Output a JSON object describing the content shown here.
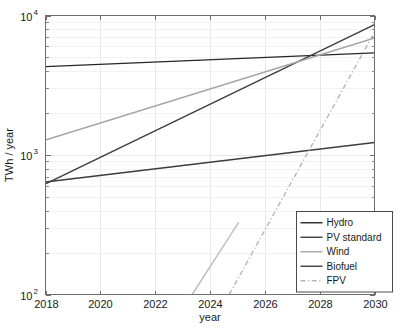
{
  "chart_data": {
    "type": "line",
    "title": "",
    "xlabel": "year",
    "ylabel": "TWh / year",
    "xlim": [
      2018,
      2030
    ],
    "ylim": [
      100,
      10000
    ],
    "yscale": "log",
    "grid": true,
    "legend_position": "lower-right",
    "xticks": [
      "2018",
      "2020",
      "2022",
      "2024",
      "2026",
      "2028",
      "2030"
    ],
    "xtick_values": [
      2018,
      2020,
      2022,
      2024,
      2026,
      2028,
      2030
    ],
    "ytick_labels": [
      "10",
      "10",
      "10"
    ],
    "ytick_exponents": [
      "2",
      "3",
      "4"
    ],
    "ytick_values": [
      100,
      1000,
      10000
    ],
    "series": [
      {
        "name": "Hydro",
        "color": "#262626",
        "width": 1.4,
        "dash": "none",
        "x": [
          2018,
          2030
        ],
        "values": [
          4300,
          5400
        ]
      },
      {
        "name": "PV standard",
        "color": "#3d3d3d",
        "width": 1.4,
        "dash": "none",
        "x": [
          2018,
          2030
        ],
        "values": [
          620,
          8600
        ]
      },
      {
        "name": "Wind",
        "color": "#a6a6a6",
        "width": 1.4,
        "dash": "none",
        "x": [
          2018,
          2030
        ],
        "values": [
          1280,
          6900
        ]
      },
      {
        "name": "Biofuel",
        "color": "#3d3d3d",
        "width": 1.4,
        "dash": "none",
        "x": [
          2018,
          2030
        ],
        "values": [
          640,
          1230
        ]
      },
      {
        "name": "FPV",
        "color": "#b5b5b5",
        "width": 1.4,
        "dash": "dashdot",
        "x": [
          2024.7,
          2030
        ],
        "values": [
          100,
          7600
        ]
      },
      {
        "name": "PV standard short",
        "color": "#bdbdbd",
        "width": 1.4,
        "dash": "none",
        "x": [
          2023.35,
          2025.05
        ],
        "values": [
          100,
          330
        ],
        "legend": false
      }
    ],
    "legend_entries": [
      {
        "label": "Hydro",
        "color": "#262626",
        "dash": "none"
      },
      {
        "label": "PV standard",
        "color": "#3d3d3d",
        "dash": "none"
      },
      {
        "label": "Wind",
        "color": "#a6a6a6",
        "dash": "none"
      },
      {
        "label": "Biofuel",
        "color": "#3d3d3d",
        "dash": "none"
      },
      {
        "label": "FPV",
        "color": "#b5b5b5",
        "dash": "dashdot"
      }
    ]
  }
}
